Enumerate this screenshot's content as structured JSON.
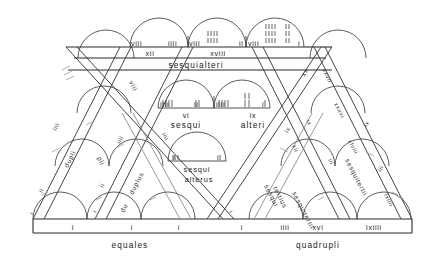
{
  "figure": {
    "type": "diagram"
  },
  "top_row": {
    "arcs": [
      {
        "left_label": "viii",
        "right_label": "iiii",
        "tallies": []
      },
      {
        "left_label": "viii",
        "right_label": "ii",
        "tallies": [
          "iiii",
          "iiii"
        ]
      },
      {
        "left_label": "viii",
        "right_label": "i",
        "tallies": [
          "iiii",
          "iiii",
          "ii",
          "ii"
        ]
      }
    ],
    "band_values": [
      "xii",
      "xviii"
    ],
    "band_word": "sesquialteri"
  },
  "middle_row": {
    "arcs": [
      {
        "left_label": "iiii",
        "right_label": "ii",
        "tallies": []
      },
      {
        "left_label": "iiii",
        "right_label": "i",
        "tallies": [
          "ii",
          "ii"
        ]
      }
    ],
    "value_left": "vi",
    "value_right": "ix",
    "word_left": "sesqui",
    "word_right": "alteri"
  },
  "inner_row": {
    "arc": {
      "left_label": "ii",
      "right_label": "i"
    },
    "word_line1": "sesqui",
    "word_line2": "alterus"
  },
  "center_right": {
    "word_line1": "sesqui",
    "word_line2": "tertius"
  },
  "baseline": {
    "values": [
      "i",
      "i",
      "i",
      "i",
      "iiii",
      "xvi",
      "lxiiii"
    ],
    "word_left": "equales",
    "word_right": "quadrupli"
  },
  "diagonals": {
    "left_outer": {
      "label": "dupli",
      "numbers": [
        "iiii",
        "ii",
        "i"
      ]
    },
    "left_inner": {
      "label": "duplus",
      "numbers": [
        "iiii",
        "ii",
        "i"
      ]
    },
    "left_mid": {
      "label": "du",
      "numbers": [
        "i"
      ]
    },
    "left_pli": {
      "label": "pli",
      "numbers": [
        "i"
      ]
    },
    "left_viii": {
      "label": "viii",
      "numbers": []
    },
    "right_outer": {
      "label": "sesquitertii",
      "numbers": [
        "xxvii",
        "xxxvi",
        "xlviii",
        "lxiiii"
      ]
    },
    "right_inner": {
      "label": "sesquitertii",
      "numbers": [
        "xii",
        "ix",
        "iii"
      ]
    },
    "right_xx": {
      "label": "xx",
      "numbers": [
        "xxvii"
      ]
    },
    "right_ix": {
      "label": "ix",
      "numbers": [
        "ix",
        "iii"
      ]
    }
  },
  "colors": {
    "ink": "#1a1a1a",
    "arc_stroke": "#4a4a4a",
    "faint_stroke": "#8c8c8c",
    "background": "#ffffff"
  }
}
